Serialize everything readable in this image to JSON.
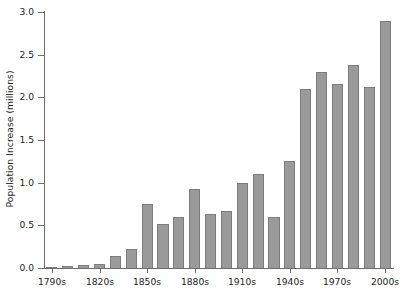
{
  "chart_data": {
    "type": "bar",
    "title": "",
    "xlabel": "",
    "ylabel": "Population Increase (millions)",
    "ylim": [
      0.0,
      3.0
    ],
    "ytick_step": 0.5,
    "ytick_labels": [
      "0.0",
      "0.5",
      "1.0",
      "1.5",
      "2.0",
      "2.5",
      "3.0"
    ],
    "ytick_values": [
      0.0,
      0.5,
      1.0,
      1.5,
      2.0,
      2.5,
      3.0
    ],
    "grid": false,
    "legend": false,
    "bar_color": "#9a9a9a",
    "bar_edge_color": "#7d7d7d",
    "axis_color": "#6d6e71",
    "categories": [
      "1790s",
      "1800s",
      "1810s",
      "1820s",
      "1830s",
      "1840s",
      "1850s",
      "1860s",
      "1870s",
      "1880s",
      "1890s",
      "1900s",
      "1910s",
      "1920s",
      "1930s",
      "1940s",
      "1950s",
      "1960s",
      "1970s",
      "1980s",
      "1990s",
      "2000s"
    ],
    "values": [
      0.01,
      0.02,
      0.04,
      0.05,
      0.14,
      0.22,
      0.75,
      0.52,
      0.6,
      0.93,
      0.63,
      0.67,
      1.0,
      1.1,
      0.6,
      1.25,
      2.1,
      2.3,
      2.16,
      2.38,
      2.12,
      2.9
    ],
    "visible_tick_labels": [
      "1790s",
      "1820s",
      "1850s",
      "1880s",
      "1910s",
      "1940s",
      "1970s",
      "2000s"
    ],
    "visible_tick_indices": [
      0,
      3,
      6,
      9,
      12,
      15,
      18,
      21
    ]
  }
}
